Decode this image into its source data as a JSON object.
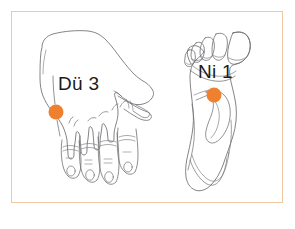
{
  "figure": {
    "type": "acupuncture-point-illustration",
    "background_color": "#ffffff",
    "frame": {
      "border_color": "#f0c9a4",
      "fill_color": "#ffffff"
    },
    "line_art_color": "#6e6e73",
    "marker_color": "#ee8030",
    "panels": [
      {
        "id": "hand",
        "subject": "back-of-hand",
        "label": "Dü 3",
        "point_name": "Dü 3",
        "marker": {
          "cx": 56,
          "cy": 112,
          "r": 7.5,
          "color": "#ee8030"
        },
        "label_position": {
          "x": 58,
          "y": 74
        }
      },
      {
        "id": "foot",
        "subject": "sole-of-foot",
        "label": "Ni 1",
        "point_name": "Ni 1",
        "marker": {
          "cx": 214,
          "cy": 95,
          "r": 7.5,
          "color": "#ee8030"
        },
        "label_position": {
          "x": 198,
          "y": 62
        }
      }
    ]
  }
}
